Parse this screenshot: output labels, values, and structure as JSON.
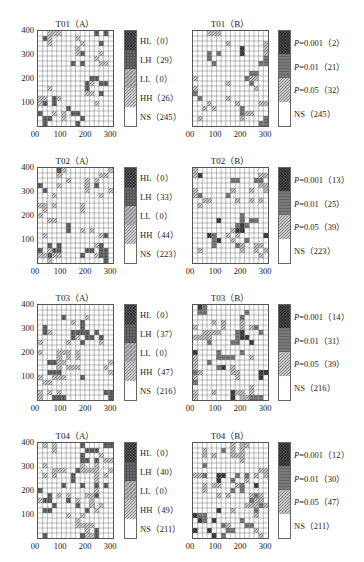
{
  "chart_data": [
    {
      "id": "T01A",
      "type": "heatmap",
      "title": "T01（A）",
      "yticks": [
        "400",
        "300",
        "200",
        "100"
      ],
      "xticks": [
        "00",
        "100",
        "200",
        "300"
      ],
      "legend": [
        {
          "key": "HL",
          "count": 0
        },
        {
          "key": "LH",
          "count": 29
        },
        {
          "key": "LL",
          "count": 0
        },
        {
          "key": "HH",
          "count": 26
        },
        {
          "key": "NS",
          "count": 245
        }
      ]
    },
    {
      "id": "T01B",
      "type": "heatmap",
      "title": "T01（B）",
      "xticks": [
        "00",
        "100",
        "200",
        "300"
      ],
      "legend": [
        {
          "key": "P=0.001",
          "count": 2
        },
        {
          "key": "P=0.01",
          "count": 21
        },
        {
          "key": "P=0.05",
          "count": 32
        },
        {
          "key": "NS",
          "count": 245
        }
      ]
    },
    {
      "id": "T02A",
      "type": "heatmap",
      "title": "T02（A）",
      "yticks": [
        "400",
        "300",
        "200",
        "100"
      ],
      "xticks": [
        "00",
        "100",
        "200",
        "300"
      ],
      "legend": [
        {
          "key": "HL",
          "count": 0
        },
        {
          "key": "LH",
          "count": 33
        },
        {
          "key": "LL",
          "count": 0
        },
        {
          "key": "HH",
          "count": 44
        },
        {
          "key": "NS",
          "count": 223
        }
      ]
    },
    {
      "id": "T02B",
      "type": "heatmap",
      "title": "T02（B）",
      "xticks": [
        "00",
        "100",
        "200",
        "300"
      ],
      "legend": [
        {
          "key": "P=0.001",
          "count": 13
        },
        {
          "key": "P=0.01",
          "count": 25
        },
        {
          "key": "P=0.05",
          "count": 39
        },
        {
          "key": "NS",
          "count": 223
        }
      ]
    },
    {
      "id": "T03A",
      "type": "heatmap",
      "title": "T03（A）",
      "yticks": [
        "400",
        "300",
        "200",
        "100"
      ],
      "xticks": [
        "00",
        "100",
        "200",
        "300"
      ],
      "legend": [
        {
          "key": "HL",
          "count": 0
        },
        {
          "key": "LH",
          "count": 37
        },
        {
          "key": "LL",
          "count": 0
        },
        {
          "key": "HH",
          "count": 47
        },
        {
          "key": "NS",
          "count": 216
        }
      ]
    },
    {
      "id": "T03B",
      "type": "heatmap",
      "title": "T03（B）",
      "xticks": [
        "00",
        "100",
        "200",
        "300"
      ],
      "legend": [
        {
          "key": "P=0.001",
          "count": 14
        },
        {
          "key": "P=0.01",
          "count": 31
        },
        {
          "key": "P=0.05",
          "count": 39
        },
        {
          "key": "NS",
          "count": 216
        }
      ]
    },
    {
      "id": "T04A",
      "type": "heatmap",
      "title": "T04（A）",
      "yticks": [
        "400",
        "300",
        "200",
        "100"
      ],
      "xticks": [
        "00",
        "100",
        "200",
        "300"
      ],
      "legend": [
        {
          "key": "HL",
          "count": 0
        },
        {
          "key": "LH",
          "count": 40
        },
        {
          "key": "LL",
          "count": 0
        },
        {
          "key": "HH",
          "count": 49
        },
        {
          "key": "NS",
          "count": 211
        }
      ]
    },
    {
      "id": "T04B",
      "type": "heatmap",
      "title": "T04（B）",
      "xticks": [
        "00",
        "100",
        "200",
        "300"
      ],
      "legend": [
        {
          "key": "P=0.001",
          "count": 12
        },
        {
          "key": "P=0.01",
          "count": 30
        },
        {
          "key": "P=0.05",
          "count": 47
        },
        {
          "key": "NS",
          "count": 211
        }
      ]
    }
  ],
  "labels": {
    "T01A": {
      "title": "T01（A）",
      "l0": "HL（0）",
      "l1": "LH（29）",
      "l2": "LL（0）",
      "l3": "HH（26）",
      "l4": "NS（245）"
    },
    "T01B": {
      "title": "T01（B）",
      "l0": "=0.001（2）",
      "l1": "=0.01（21）",
      "l2": "=0.05（32）",
      "l3": "NS（245）"
    },
    "T02A": {
      "title": "T02（A）",
      "l0": "HL（0）",
      "l1": "LH（33）",
      "l2": "LL（0）",
      "l3": "HH（44）",
      "l4": "NS（223）"
    },
    "T02B": {
      "title": "T02（B）",
      "l0": "=0.001（13）",
      "l1": "=0.01（25）",
      "l2": "=0.05（39）",
      "l3": "NS（223）"
    },
    "T03A": {
      "title": "T03（A）",
      "l0": "HL（0）",
      "l1": "LH（37）",
      "l2": "LL（0）",
      "l3": "HH（47）",
      "l4": "NS（216）"
    },
    "T03B": {
      "title": "T03（B）",
      "l0": "=0.001（14）",
      "l1": "=0.01（31）",
      "l2": "=0.05（39）",
      "l3": "NS（216）"
    },
    "T04A": {
      "title": "T04（A）",
      "l0": "HL（0）",
      "l1": "LH（40）",
      "l2": "LL（0）",
      "l3": "HH（49）",
      "l4": "NS（211）"
    },
    "T04B": {
      "title": "T04（B）",
      "l0": "=0.001（12）",
      "l1": "=0.01（30）",
      "l2": "=0.05（47）",
      "l3": "NS（211）"
    }
  },
  "axis": {
    "y400": "400",
    "y300": "300",
    "y200": "200",
    "y100": "100",
    "x0": "00",
    "x100": "100",
    "x200": "200",
    "x300": "300",
    "p": "P"
  },
  "colors": {
    "grid_line": "#555555",
    "lh_dark": "#5a5a5a",
    "hh_hatch": "#8a8a8a",
    "p001": "#3a3a3a",
    "p01": "#707070",
    "p05": "#9a9a9a"
  }
}
